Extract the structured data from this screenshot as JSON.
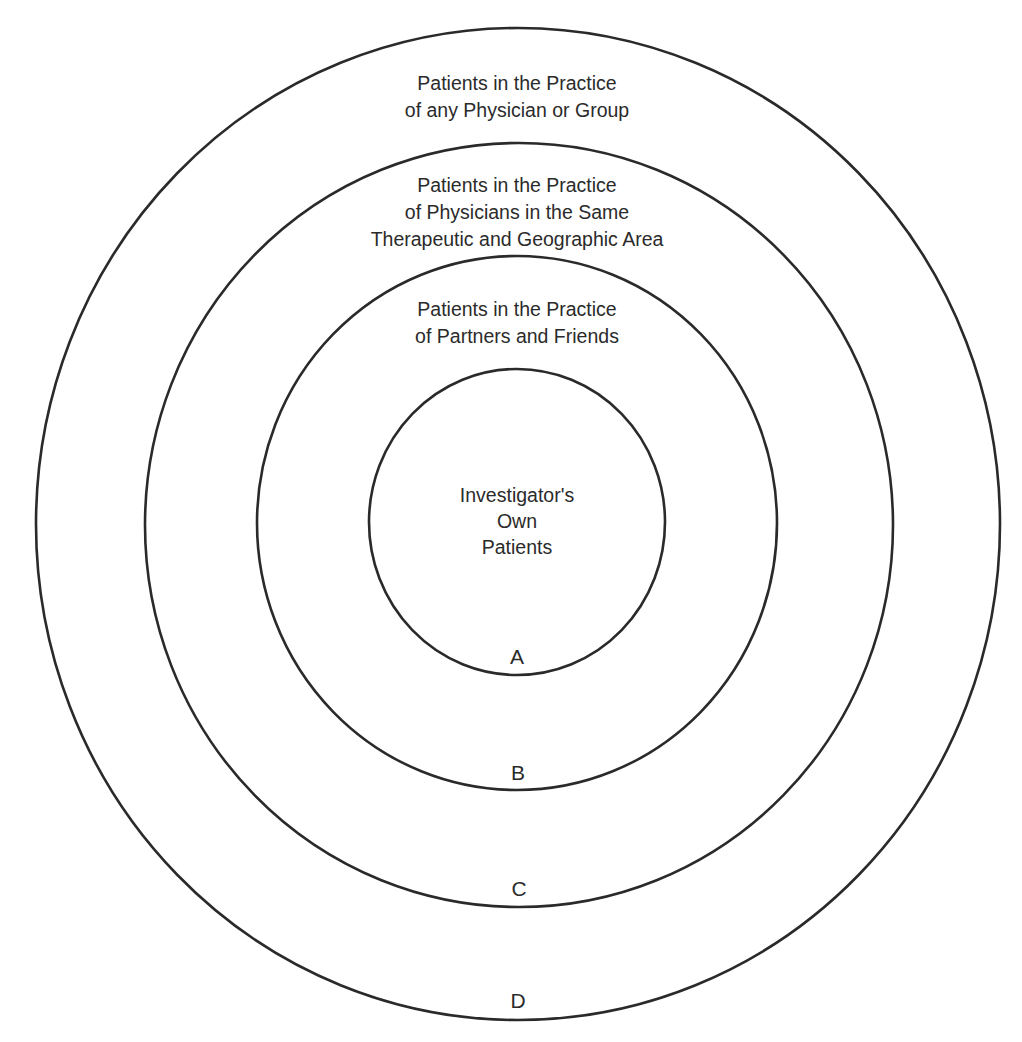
{
  "diagram": {
    "type": "concentric-circles",
    "stroke_color": "#2a2a2a",
    "background": "#ffffff",
    "rings": [
      {
        "id": "A",
        "letter": "A",
        "label": "Investigator's\nOwn\nPatients",
        "shape": {
          "cx": 517,
          "cy": 522,
          "rx": 148,
          "ry": 153
        }
      },
      {
        "id": "B",
        "letter": "B",
        "label": "Patients in the Practice\nof Partners and Friends",
        "shape": {
          "cx": 517,
          "cy": 523,
          "rx": 260,
          "ry": 267
        }
      },
      {
        "id": "C",
        "letter": "C",
        "label": "Patients in the Practice\nof Physicians in the Same\nTherapeutic and Geographic Area",
        "shape": {
          "cx": 519,
          "cy": 525,
          "rx": 374,
          "ry": 382
        }
      },
      {
        "id": "D",
        "letter": "D",
        "label": "Patients in the Practice\nof any Physician or Group",
        "shape": {
          "cx": 518,
          "cy": 524,
          "rx": 482,
          "ry": 496
        }
      }
    ]
  }
}
